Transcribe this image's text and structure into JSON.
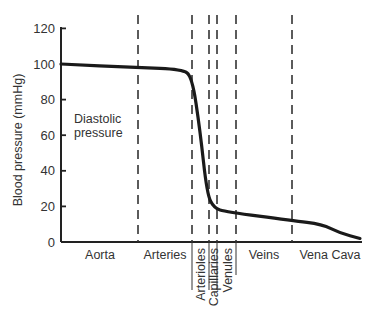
{
  "chart_data": {
    "type": "line",
    "title": "",
    "xlabel": "",
    "ylabel": "Blood pressure (mmHg)",
    "ylim": [
      0,
      125
    ],
    "yticks": [
      0,
      20,
      40,
      60,
      80,
      100,
      120
    ],
    "grid": false,
    "legend": null,
    "annotation": {
      "line1": "Diastolic",
      "line2": "pressure"
    },
    "regions": [
      {
        "name": "Aorta",
        "orientation": "horizontal"
      },
      {
        "name": "Arteries",
        "orientation": "horizontal"
      },
      {
        "name": "Arterioles",
        "orientation": "vertical"
      },
      {
        "name": "Capillaries",
        "orientation": "vertical"
      },
      {
        "name": "Venules",
        "orientation": "vertical"
      },
      {
        "name": "Veins",
        "orientation": "horizontal"
      },
      {
        "name": "Vena Cava",
        "orientation": "horizontal"
      }
    ],
    "series": [
      {
        "name": "Diastolic pressure",
        "color": "#1a1a1a",
        "points": [
          {
            "region": "Aorta start",
            "value": 100
          },
          {
            "region": "Aorta/Arteries boundary",
            "value": 98
          },
          {
            "region": "Arteries late",
            "value": 97
          },
          {
            "region": "Arteries/Arterioles boundary",
            "value": 93
          },
          {
            "region": "Arterioles mid",
            "value": 63
          },
          {
            "region": "Arterioles end",
            "value": 27
          },
          {
            "region": "Capillaries",
            "value": 19
          },
          {
            "region": "Venules",
            "value": 17
          },
          {
            "region": "Veins/Vena Cava boundary",
            "value": 12
          },
          {
            "region": "Vena Cava mid",
            "value": 10
          },
          {
            "region": "Vena Cava late",
            "value": 5
          },
          {
            "region": "Vena Cava end",
            "value": 2
          }
        ]
      }
    ]
  }
}
